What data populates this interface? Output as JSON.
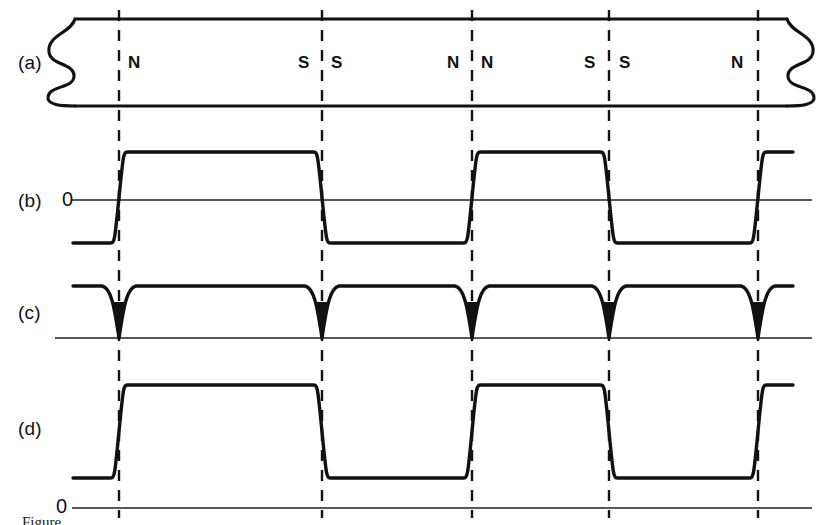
{
  "figure": {
    "domain_type": "diagram",
    "width": 821,
    "height": 525,
    "background_color": "#ffffff",
    "ink_color": "#111111",
    "axis_color": "#222222"
  },
  "panels": [
    {
      "id": "a",
      "label": "(a)",
      "label_x": 18,
      "label_y": 52
    },
    {
      "id": "b",
      "label": "(b)",
      "label_x": 18,
      "label_y": 190
    },
    {
      "id": "c",
      "label": "(c)",
      "label_x": 18,
      "label_y": 302
    },
    {
      "id": "d",
      "label": "(d)",
      "label_x": 18,
      "label_y": 418
    }
  ],
  "zero_labels": [
    {
      "panel": "b",
      "text": "0",
      "x": 62,
      "y": 188
    },
    {
      "panel": "d",
      "text": "0",
      "x": 56,
      "y": 495
    }
  ],
  "tape": {
    "left_edge": 75,
    "right_edge": 787,
    "top": 19,
    "bottom": 106,
    "break_style": "wavy-broken-ends"
  },
  "transition_lines": [
    {
      "index": 0,
      "x": 119
    },
    {
      "index": 1,
      "x": 322
    },
    {
      "index": 2,
      "x": 472
    },
    {
      "index": 3,
      "x": 609
    },
    {
      "index": 4,
      "x": 758
    }
  ],
  "pole_labels": [
    {
      "text": "N",
      "x": 128,
      "y": 53,
      "side": "right-of-line",
      "line_index": 0
    },
    {
      "text": "S",
      "x": 298,
      "y": 53,
      "side": "left-of-line",
      "line_index": 1
    },
    {
      "text": "S",
      "x": 331,
      "y": 53,
      "side": "right-of-line",
      "line_index": 1
    },
    {
      "text": "N",
      "x": 447,
      "y": 53,
      "side": "left-of-line",
      "line_index": 2
    },
    {
      "text": "N",
      "x": 481,
      "y": 53,
      "side": "right-of-line",
      "line_index": 2
    },
    {
      "text": "S",
      "x": 584,
      "y": 53,
      "side": "left-of-line",
      "line_index": 3
    },
    {
      "text": "S",
      "x": 619,
      "y": 53,
      "side": "right-of-line",
      "line_index": 3
    },
    {
      "text": "N",
      "x": 731,
      "y": 53,
      "side": "left-of-line",
      "line_index": 4
    }
  ],
  "chart_data": {
    "type": "line",
    "title": "",
    "xlabel": "",
    "ylabel": "",
    "x_transitions": [
      119,
      322,
      472,
      609,
      758
    ],
    "trace_start_x": 55,
    "trace_end_x": 793,
    "series": [
      {
        "name": "b",
        "kind": "bipolar-square",
        "zero_y": 200,
        "high_y": 152,
        "low_y": 243,
        "levels": [
          "low",
          "high",
          "low",
          "high",
          "low",
          "high"
        ],
        "axis_line": {
          "x1": 72,
          "x2": 812,
          "y": 200
        }
      },
      {
        "name": "c",
        "kind": "dip-pulses",
        "baseline_y": 338,
        "top_y": 286,
        "dip_bottom_y": 338,
        "dip_width": 22,
        "axis_line": {
          "x1": 55,
          "x2": 812,
          "y": 338
        }
      },
      {
        "name": "d",
        "kind": "unipolar-square",
        "zero_y": 508,
        "high_y": 385,
        "low_y": 478,
        "levels": [
          "low",
          "high",
          "low",
          "high",
          "low",
          "high"
        ],
        "axis_line": {
          "x1": 72,
          "x2": 812,
          "y": 508
        }
      }
    ]
  },
  "caption": {
    "clipped": true,
    "text": "Figure"
  }
}
